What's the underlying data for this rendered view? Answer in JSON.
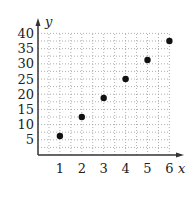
{
  "chart_data": {
    "type": "scatter",
    "title": "",
    "xlabel": "x",
    "ylabel": "y",
    "x": [
      1,
      2,
      3,
      4,
      5,
      6
    ],
    "y": [
      6.25,
      12.5,
      18.75,
      25,
      31.25,
      37.5
    ],
    "xticks": [
      1,
      2,
      3,
      4,
      5,
      6
    ],
    "yticks": [
      5,
      10,
      15,
      20,
      25,
      30,
      35,
      40
    ],
    "xlim": [
      0,
      6.3
    ],
    "ylim": [
      0,
      41
    ],
    "grid": true,
    "grid_style": "dotted",
    "legend": null,
    "colors": {
      "points": "#111111",
      "axes": "#333333",
      "grid": "#999999"
    }
  }
}
